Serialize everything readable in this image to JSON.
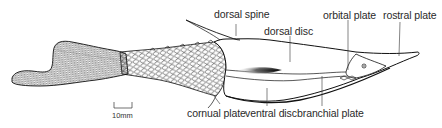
{
  "figure": {
    "labels": {
      "dorsal_spine": "dorsal spine",
      "dorsal_disc": "dorsal disc",
      "orbital_plate": "orbital plate",
      "rostral_plate": "rostral plate",
      "cornual_plate": "cornual plate",
      "ventral_disc": "ventral disc",
      "branchial_plate": "branchial plate"
    },
    "scale_bar": {
      "label": "10mm"
    },
    "colors": {
      "line": "#1a1a1a",
      "background": "#ffffff",
      "text": "#2a2a2a"
    }
  }
}
